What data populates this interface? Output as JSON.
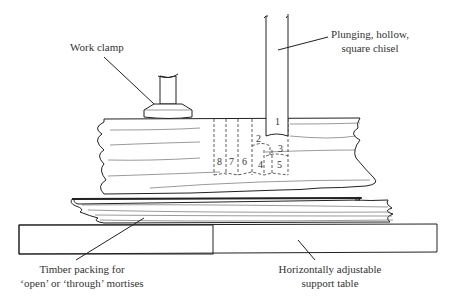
{
  "diagram": {
    "labels": {
      "work_clamp": "Work clamp",
      "chisel_line1": "Plunging, hollow,",
      "chisel_line2": "square chisel",
      "packing_line1": "Timber packing for",
      "packing_line2": "‘open’ or ‘through’ mortises",
      "table_line1": "Horizontally adjustable",
      "table_line2": "support table"
    },
    "cut_sequence": [
      "1",
      "2",
      "3",
      "4",
      "5",
      "6",
      "7",
      "8"
    ],
    "colors": {
      "line": "#222222",
      "text": "#333333",
      "background": "#ffffff"
    }
  }
}
